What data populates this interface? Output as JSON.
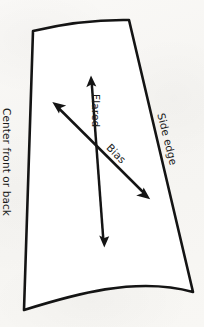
{
  "diagram": {
    "background_color": "#f8f7f5",
    "ink_color": "#141414",
    "fill_color": "#ffffff",
    "labels": {
      "center_front_or_back": "Center front or back",
      "side_edge": "Side edge",
      "flared": "Flared",
      "bias": "Bias"
    },
    "shape": {
      "name": "pattern-piece-outline",
      "corners": {
        "top_left": [
          33,
          31
        ],
        "top_right": [
          129,
          20
        ],
        "bottom_right": [
          193,
          292
        ],
        "bottom_left": [
          24,
          310
        ]
      }
    },
    "arrows": [
      {
        "name": "flared-arrow",
        "label": "Flared",
        "double_headed": true,
        "start": [
          91,
          77
        ],
        "end": [
          104,
          246
        ]
      },
      {
        "name": "bias-arrow",
        "label": "Bias",
        "double_headed": true,
        "start": [
          53,
          103
        ],
        "end": [
          149,
          198
        ]
      }
    ]
  }
}
